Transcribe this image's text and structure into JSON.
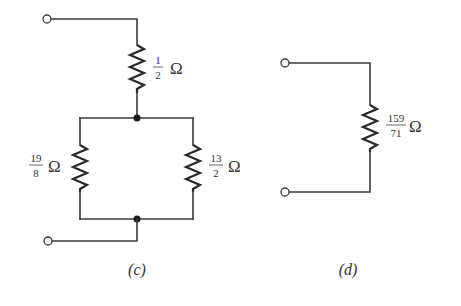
{
  "diagrams": [
    {
      "caption": "(c)",
      "resistors": [
        {
          "id": "top",
          "numerator": "1",
          "denominator": "2",
          "unit": "Ω"
        },
        {
          "id": "left",
          "numerator": "19",
          "denominator": "8",
          "unit": "Ω"
        },
        {
          "id": "right",
          "numerator": "13",
          "denominator": "2",
          "unit": "Ω"
        }
      ]
    },
    {
      "caption": "(d)",
      "resistors": [
        {
          "id": "equivalent",
          "numerator": "159",
          "denominator": "71",
          "unit": "Ω"
        }
      ]
    }
  ]
}
